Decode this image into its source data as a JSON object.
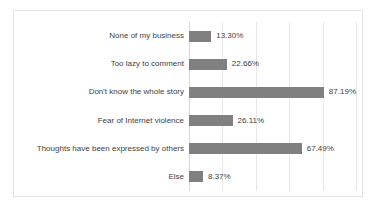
{
  "chart_data": {
    "type": "bar",
    "orientation": "horizontal",
    "title": "",
    "xlabel": "",
    "ylabel": "",
    "xlim": [
      0,
      100
    ],
    "grid": true,
    "legend": false,
    "value_suffix": "%",
    "bar_color": "#808080",
    "categories": [
      "None of my business",
      "Too lazy to comment",
      "Don't know the whole story",
      "Fear of Internet violence",
      "Thoughts have been expressed by others",
      "Else"
    ],
    "values": [
      13.3,
      22.66,
      87.19,
      26.11,
      67.49,
      8.37
    ],
    "value_labels": [
      "13.30%",
      "22.66%",
      "87.19%",
      "26.11%",
      "67.49%",
      "8.37%"
    ],
    "gridline_positions": [
      0,
      20,
      40,
      60,
      80,
      100
    ]
  }
}
